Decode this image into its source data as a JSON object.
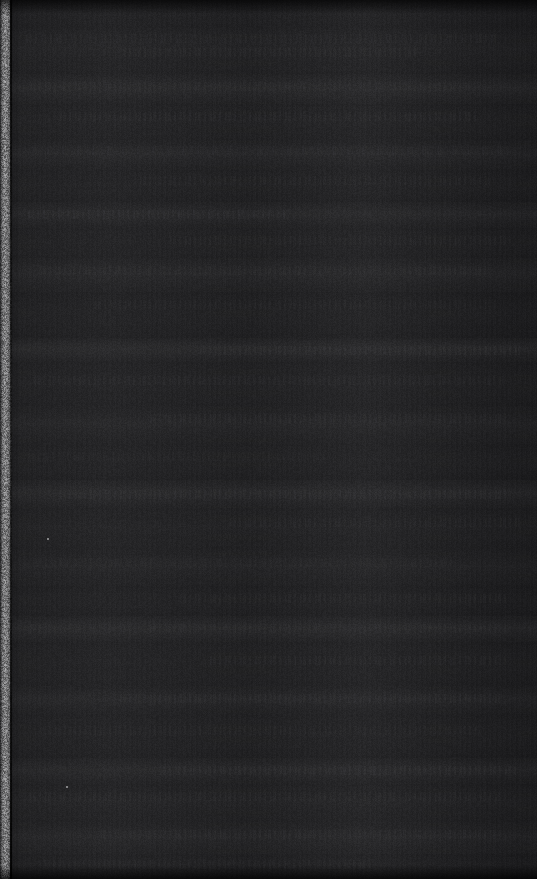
{
  "capture": {
    "title": "Underexposed dark scan capture",
    "width": 537,
    "height": 879,
    "legible_content": "none",
    "description": "Near-black frame with a noisy light vertical margin strip along the left edge. No readable text, icons, or UI controls are present.",
    "colors": {
      "background_dark": "#1d1d1f",
      "field_lightest": "#262628",
      "field_darkest": "#111113",
      "left_strip_light": "#b4b4b6",
      "left_strip_mid": "#8e8e90",
      "left_strip_dark": "#2a2a2c",
      "speck": "#cfcfd2"
    }
  },
  "left_margin_strip": {
    "x": 0,
    "width": 12,
    "height": 879,
    "character": "high-noise light gray film/scan margin"
  },
  "horizontal_bands": [
    {
      "y": 0,
      "height": 28,
      "lightness": 0.01
    },
    {
      "y": 28,
      "height": 46,
      "lightness": 0.028
    },
    {
      "y": 74,
      "height": 30,
      "lightness": 0.046
    },
    {
      "y": 104,
      "height": 36,
      "lightness": 0.022
    },
    {
      "y": 140,
      "height": 30,
      "lightness": 0.038
    },
    {
      "y": 170,
      "height": 32,
      "lightness": 0.018
    },
    {
      "y": 202,
      "height": 26,
      "lightness": 0.044
    },
    {
      "y": 228,
      "height": 30,
      "lightness": 0.02
    },
    {
      "y": 258,
      "height": 34,
      "lightness": 0.04
    },
    {
      "y": 292,
      "height": 46,
      "lightness": 0.016
    },
    {
      "y": 338,
      "height": 24,
      "lightness": 0.05
    },
    {
      "y": 362,
      "height": 44,
      "lightness": 0.024
    },
    {
      "y": 406,
      "height": 38,
      "lightness": 0.034
    },
    {
      "y": 444,
      "height": 36,
      "lightness": 0.018
    },
    {
      "y": 480,
      "height": 28,
      "lightness": 0.048
    },
    {
      "y": 508,
      "height": 42,
      "lightness": 0.022
    },
    {
      "y": 550,
      "height": 36,
      "lightness": 0.032
    },
    {
      "y": 586,
      "height": 30,
      "lightness": 0.016
    },
    {
      "y": 616,
      "height": 26,
      "lightness": 0.046
    },
    {
      "y": 642,
      "height": 44,
      "lightness": 0.02
    },
    {
      "y": 686,
      "height": 28,
      "lightness": 0.038
    },
    {
      "y": 714,
      "height": 44,
      "lightness": 0.018
    },
    {
      "y": 758,
      "height": 26,
      "lightness": 0.044
    },
    {
      "y": 784,
      "height": 38,
      "lightness": 0.026
    },
    {
      "y": 822,
      "height": 32,
      "lightness": 0.034
    },
    {
      "y": 854,
      "height": 25,
      "lightness": 0.012
    }
  ],
  "text_rows": [
    {
      "y": 34,
      "x": 26,
      "width": 470,
      "opacity": 0.3
    },
    {
      "y": 48,
      "x": 120,
      "width": 300,
      "opacity": 0.22
    },
    {
      "y": 82,
      "x": 30,
      "width": 440,
      "opacity": 0.18
    },
    {
      "y": 112,
      "x": 60,
      "width": 420,
      "opacity": 0.26
    },
    {
      "y": 146,
      "x": 32,
      "width": 480,
      "opacity": 0.24
    },
    {
      "y": 176,
      "x": 140,
      "width": 350,
      "opacity": 0.2
    },
    {
      "y": 210,
      "x": 28,
      "width": 260,
      "opacity": 0.3
    },
    {
      "y": 236,
      "x": 170,
      "width": 340,
      "opacity": 0.18
    },
    {
      "y": 266,
      "x": 40,
      "width": 450,
      "opacity": 0.22
    },
    {
      "y": 300,
      "x": 95,
      "width": 400,
      "opacity": 0.16
    },
    {
      "y": 346,
      "x": 200,
      "width": 320,
      "opacity": 0.28
    },
    {
      "y": 376,
      "x": 34,
      "width": 470,
      "opacity": 0.2
    },
    {
      "y": 414,
      "x": 150,
      "width": 360,
      "opacity": 0.24
    },
    {
      "y": 452,
      "x": 28,
      "width": 300,
      "opacity": 0.18
    },
    {
      "y": 490,
      "x": 60,
      "width": 450,
      "opacity": 0.26
    },
    {
      "y": 518,
      "x": 230,
      "width": 290,
      "opacity": 0.2
    },
    {
      "y": 558,
      "x": 36,
      "width": 420,
      "opacity": 0.16
    },
    {
      "y": 594,
      "x": 180,
      "width": 330,
      "opacity": 0.22
    },
    {
      "y": 624,
      "x": 30,
      "width": 480,
      "opacity": 0.18
    },
    {
      "y": 656,
      "x": 210,
      "width": 300,
      "opacity": 0.24
    },
    {
      "y": 694,
      "x": 120,
      "width": 380,
      "opacity": 0.26
    },
    {
      "y": 726,
      "x": 40,
      "width": 440,
      "opacity": 0.18
    },
    {
      "y": 766,
      "x": 160,
      "width": 360,
      "opacity": 0.28
    },
    {
      "y": 792,
      "x": 30,
      "width": 470,
      "opacity": 0.22
    },
    {
      "y": 830,
      "x": 100,
      "width": 400,
      "opacity": 0.2
    },
    {
      "y": 860,
      "x": 44,
      "width": 330,
      "opacity": 0.16
    }
  ],
  "specks": [
    {
      "x": 47,
      "y": 538
    },
    {
      "x": 66,
      "y": 786
    }
  ]
}
